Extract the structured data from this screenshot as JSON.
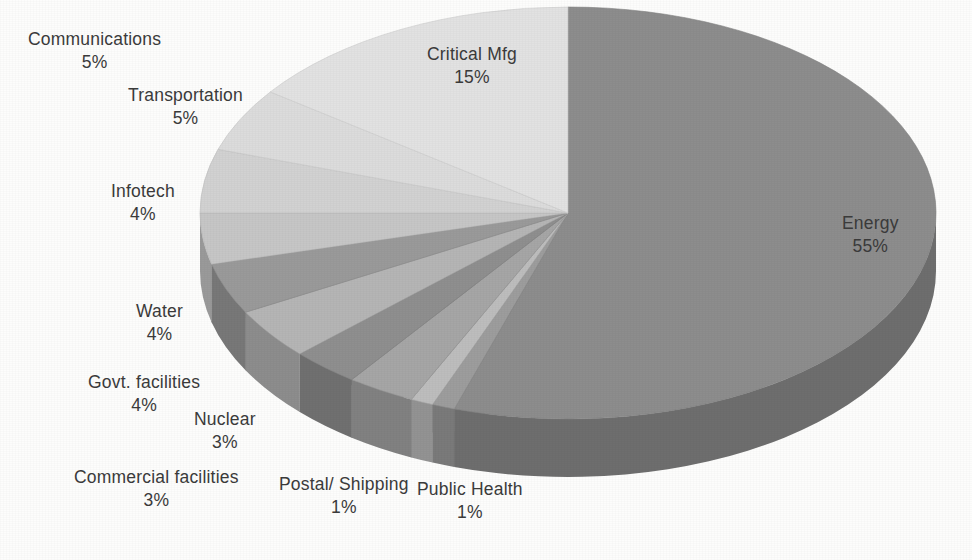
{
  "chart_data": {
    "type": "pie",
    "title": "",
    "subtitle": "",
    "xlabel": "",
    "ylabel": "",
    "legend_position": "none",
    "grid": false,
    "style": "3d-exploded-grayscale",
    "units": "percent",
    "start_angle_deg": 0,
    "direction": "clockwise",
    "categories": [
      "Energy",
      "Public Health",
      "Postal/ Shipping",
      "Commercial facilities",
      "Nuclear",
      "Govt. facilities",
      "Water",
      "Infotech",
      "Transportation",
      "Communications",
      "Critical Mfg"
    ],
    "values": [
      55,
      1,
      1,
      3,
      3,
      4,
      4,
      4,
      5,
      5,
      15
    ],
    "value_labels": [
      "55%",
      "1%",
      "1%",
      "3%",
      "3%",
      "4%",
      "4%",
      "4%",
      "5%",
      "5%",
      "15%"
    ],
    "slice_colors": [
      "#8d8d8d",
      "#9d9d9d",
      "#bdbdbd",
      "#a6a6a6",
      "#8f8f8f",
      "#b5b5b5",
      "#9a9a9a",
      "#c6c6c6",
      "#d2d2d2",
      "#dcdcdc",
      "#e2e2e2"
    ],
    "total": 100
  },
  "labels": [
    {
      "name": "Communications",
      "value": "5%"
    },
    {
      "name": "Transportation",
      "value": "5%"
    },
    {
      "name": "Infotech",
      "value": "4%"
    },
    {
      "name": "Water",
      "value": "4%"
    },
    {
      "name": "Govt. facilities",
      "value": "4%"
    },
    {
      "name": "Nuclear",
      "value": "3%"
    },
    {
      "name": "Commercial facilities",
      "value": "3%"
    },
    {
      "name": "Postal/ Shipping",
      "value": "1%"
    },
    {
      "name": "Public Health",
      "value": "1%"
    },
    {
      "name": "Critical Mfg",
      "value": "15%"
    },
    {
      "name": "Energy",
      "value": "55%"
    }
  ],
  "colors": {
    "background": "#fdfdfc",
    "label_text": "#3b3b3b",
    "pie_darkest": "#6a6a6a",
    "pie_lightest": "#e2e2e2"
  }
}
